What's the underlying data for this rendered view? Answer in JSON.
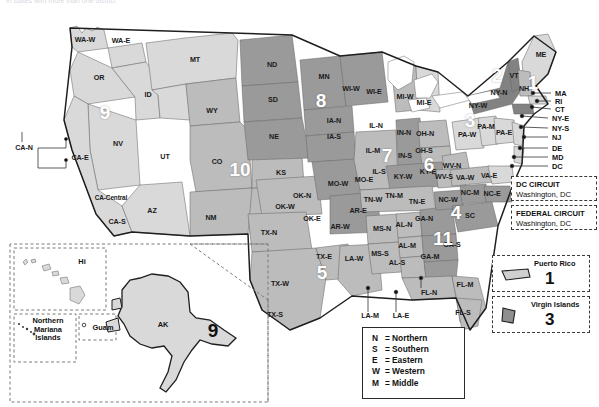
{
  "header": {
    "truncated_caption": "in states with more than one district"
  },
  "map": {
    "title": "United States Federal Judicial Circuits and District Courts",
    "circuits": [
      {
        "number": "1",
        "x": 533,
        "y": 82,
        "states": "ME, NH, MA, RI, PR"
      },
      {
        "number": "2",
        "x": 497,
        "y": 75,
        "states": "NY, VT, CT"
      },
      {
        "number": "3",
        "x": 470,
        "y": 120,
        "states": "PA, NJ, DE, VI"
      },
      {
        "number": "4",
        "x": 456,
        "y": 212,
        "states": "MD, VA, WV, NC, SC"
      },
      {
        "number": "5",
        "x": 322,
        "y": 272,
        "states": "TX, LA, MS"
      },
      {
        "number": "6",
        "x": 429,
        "y": 164,
        "states": "KY, TN, OH, MI"
      },
      {
        "number": "7",
        "x": 387,
        "y": 155,
        "states": "IL, IN, WI"
      },
      {
        "number": "8",
        "x": 321,
        "y": 100,
        "states": "ND, SD, NE, MN, IA, MO, AR"
      },
      {
        "number": "9",
        "x": 105,
        "y": 112,
        "states": "CA, OR, WA, NV, ID, MT, AZ, AK, HI, GU, MP"
      },
      {
        "number": "10",
        "x": 240,
        "y": 169,
        "states": "CO, WY, UT, NM, KS, OK"
      },
      {
        "number": "11",
        "x": 443,
        "y": 238,
        "states": "AL, GA, FL"
      },
      {
        "number": "9-alaska",
        "x": 213,
        "y": 330,
        "states": "AK",
        "dark": true
      }
    ],
    "district_labels": [
      {
        "text": "WA-W",
        "x": 85,
        "y": 40
      },
      {
        "text": "WA-E",
        "x": 121,
        "y": 41
      },
      {
        "text": "OR",
        "x": 99,
        "y": 78
      },
      {
        "text": "ID",
        "x": 148,
        "y": 95
      },
      {
        "text": "MT",
        "x": 195,
        "y": 60
      },
      {
        "text": "ND",
        "x": 272,
        "y": 65
      },
      {
        "text": "SD",
        "x": 273,
        "y": 100
      },
      {
        "text": "MN",
        "x": 324,
        "y": 77
      },
      {
        "text": "WY",
        "x": 212,
        "y": 111
      },
      {
        "text": "NE",
        "x": 274,
        "y": 137
      },
      {
        "text": "NV",
        "x": 118,
        "y": 144
      },
      {
        "text": "UT",
        "x": 165,
        "y": 157
      },
      {
        "text": "CO",
        "x": 217,
        "y": 162
      },
      {
        "text": "KS",
        "x": 281,
        "y": 173
      },
      {
        "text": "AZ",
        "x": 152,
        "y": 211
      },
      {
        "text": "NM",
        "x": 211,
        "y": 218
      },
      {
        "text": "CA-N",
        "x": 24,
        "y": 148
      },
      {
        "text": "CA-E",
        "x": 80,
        "y": 158
      },
      {
        "text": "CA-Central",
        "x": 111,
        "y": 198
      },
      {
        "text": "CA-S",
        "x": 117,
        "y": 222
      },
      {
        "text": "OK-N",
        "x": 302,
        "y": 196
      },
      {
        "text": "OK-W",
        "x": 285,
        "y": 207
      },
      {
        "text": "OK-E",
        "x": 312,
        "y": 219
      },
      {
        "text": "TX-N",
        "x": 269,
        "y": 233
      },
      {
        "text": "TX-E",
        "x": 324,
        "y": 257
      },
      {
        "text": "TX-W",
        "x": 280,
        "y": 284
      },
      {
        "text": "TX-S",
        "x": 275,
        "y": 315
      },
      {
        "text": "IA-N",
        "x": 334,
        "y": 121
      },
      {
        "text": "IA-S",
        "x": 334,
        "y": 137
      },
      {
        "text": "MO-W",
        "x": 338,
        "y": 184
      },
      {
        "text": "MO-E",
        "x": 364,
        "y": 180
      },
      {
        "text": "AR-E",
        "x": 358,
        "y": 211
      },
      {
        "text": "AR-W",
        "x": 340,
        "y": 227
      },
      {
        "text": "LA-W",
        "x": 354,
        "y": 259
      },
      {
        "text": "LA-M",
        "x": 370,
        "y": 316
      },
      {
        "text": "LA-E",
        "x": 401,
        "y": 316
      },
      {
        "text": "MS-N",
        "x": 382,
        "y": 229
      },
      {
        "text": "MS-S",
        "x": 380,
        "y": 254
      },
      {
        "text": "WI-W",
        "x": 351,
        "y": 89
      },
      {
        "text": "WI-E",
        "x": 374,
        "y": 92
      },
      {
        "text": "IL-N",
        "x": 376,
        "y": 126
      },
      {
        "text": "IL-M",
        "x": 373,
        "y": 151
      },
      {
        "text": "IL-S",
        "x": 379,
        "y": 172
      },
      {
        "text": "IN-N",
        "x": 404,
        "y": 133
      },
      {
        "text": "IN-S",
        "x": 405,
        "y": 156
      },
      {
        "text": "MI-W",
        "x": 405,
        "y": 97
      },
      {
        "text": "MI-E",
        "x": 424,
        "y": 103
      },
      {
        "text": "OH-N",
        "x": 425,
        "y": 134
      },
      {
        "text": "OH-S",
        "x": 424,
        "y": 151
      },
      {
        "text": "KY-W",
        "x": 403,
        "y": 177
      },
      {
        "text": "KY-E",
        "x": 428,
        "y": 172
      },
      {
        "text": "TN-W",
        "x": 373,
        "y": 200
      },
      {
        "text": "TN-M",
        "x": 394,
        "y": 196
      },
      {
        "text": "TN-E",
        "x": 417,
        "y": 202
      },
      {
        "text": "WV-N",
        "x": 452,
        "y": 166
      },
      {
        "text": "WV-S",
        "x": 444,
        "y": 177
      },
      {
        "text": "VA-W",
        "x": 465,
        "y": 178
      },
      {
        "text": "VA-E",
        "x": 489,
        "y": 176
      },
      {
        "text": "NC-W",
        "x": 448,
        "y": 200
      },
      {
        "text": "NC-M",
        "x": 470,
        "y": 193
      },
      {
        "text": "NC-E",
        "x": 492,
        "y": 194
      },
      {
        "text": "SC",
        "x": 470,
        "y": 216
      },
      {
        "text": "GA-N",
        "x": 424,
        "y": 219
      },
      {
        "text": "GA-M",
        "x": 430,
        "y": 257
      },
      {
        "text": "GA-S",
        "x": 452,
        "y": 245
      },
      {
        "text": "AL-N",
        "x": 404,
        "y": 225
      },
      {
        "text": "AL-M",
        "x": 407,
        "y": 246
      },
      {
        "text": "AL-S",
        "x": 397,
        "y": 263
      },
      {
        "text": "FL-N",
        "x": 429,
        "y": 293
      },
      {
        "text": "FL-M",
        "x": 465,
        "y": 285
      },
      {
        "text": "FL-S",
        "x": 463,
        "y": 313
      },
      {
        "text": "PA-W",
        "x": 467,
        "y": 135
      },
      {
        "text": "PA-M",
        "x": 486,
        "y": 127
      },
      {
        "text": "PA-E",
        "x": 504,
        "y": 133
      },
      {
        "text": "NY-W",
        "x": 478,
        "y": 106
      },
      {
        "text": "NY-N",
        "x": 499,
        "y": 93
      },
      {
        "text": "VT",
        "x": 514,
        "y": 76
      },
      {
        "text": "NH",
        "x": 524,
        "y": 89
      },
      {
        "text": "ME",
        "x": 541,
        "y": 55
      }
    ],
    "callouts": [
      {
        "text": "MA",
        "x": 555,
        "y": 93
      },
      {
        "text": "RI",
        "x": 555,
        "y": 101
      },
      {
        "text": "CT",
        "x": 555,
        "y": 109
      },
      {
        "text": "NY-E",
        "x": 552,
        "y": 118
      },
      {
        "text": "NY-S",
        "x": 552,
        "y": 128
      },
      {
        "text": "NJ",
        "x": 552,
        "y": 137
      },
      {
        "text": "DE",
        "x": 552,
        "y": 148
      },
      {
        "text": "MD",
        "x": 552,
        "y": 157
      },
      {
        "text": "DC",
        "x": 552,
        "y": 166
      }
    ],
    "circuit_boxes": [
      {
        "title": "DC CIRCUIT",
        "subtitle": "Washington, DC",
        "x": 511,
        "y": 176
      },
      {
        "title": "FEDERAL CIRCUIT",
        "subtitle": "Washington, DC",
        "x": 511,
        "y": 205
      }
    ],
    "territories": [
      {
        "name": "Puerto Rico",
        "number": "1",
        "x": 492,
        "y": 255
      },
      {
        "name": "Virgin Islands",
        "number": "3",
        "x": 492,
        "y": 296
      }
    ],
    "insets": [
      {
        "label": "Hi",
        "x": 82,
        "y": 262
      },
      {
        "label": "Northern\nMariana\nIslands",
        "x": 48,
        "y": 330
      },
      {
        "label": "Guam",
        "x": 103,
        "y": 328
      },
      {
        "label": "AK",
        "x": 163,
        "y": 325
      }
    ]
  },
  "key_legend": {
    "rows": [
      {
        "abbr": "N",
        "eq": "=",
        "word": "Northern"
      },
      {
        "abbr": "S",
        "eq": "=",
        "word": "Southern"
      },
      {
        "abbr": "E",
        "eq": "=",
        "word": "Eastern"
      },
      {
        "abbr": "W",
        "eq": "=",
        "word": "Western"
      },
      {
        "abbr": "M",
        "eq": "=",
        "word": "Middle"
      }
    ]
  },
  "colors": {
    "shade_light": "#d9d9d9",
    "shade_mid": "#bcbcbc",
    "shade_dark": "#9a9a9a",
    "shade_darker": "#828282",
    "outline": "#1e1e1e",
    "thin_line": "#555555",
    "background": "#ffffff"
  }
}
